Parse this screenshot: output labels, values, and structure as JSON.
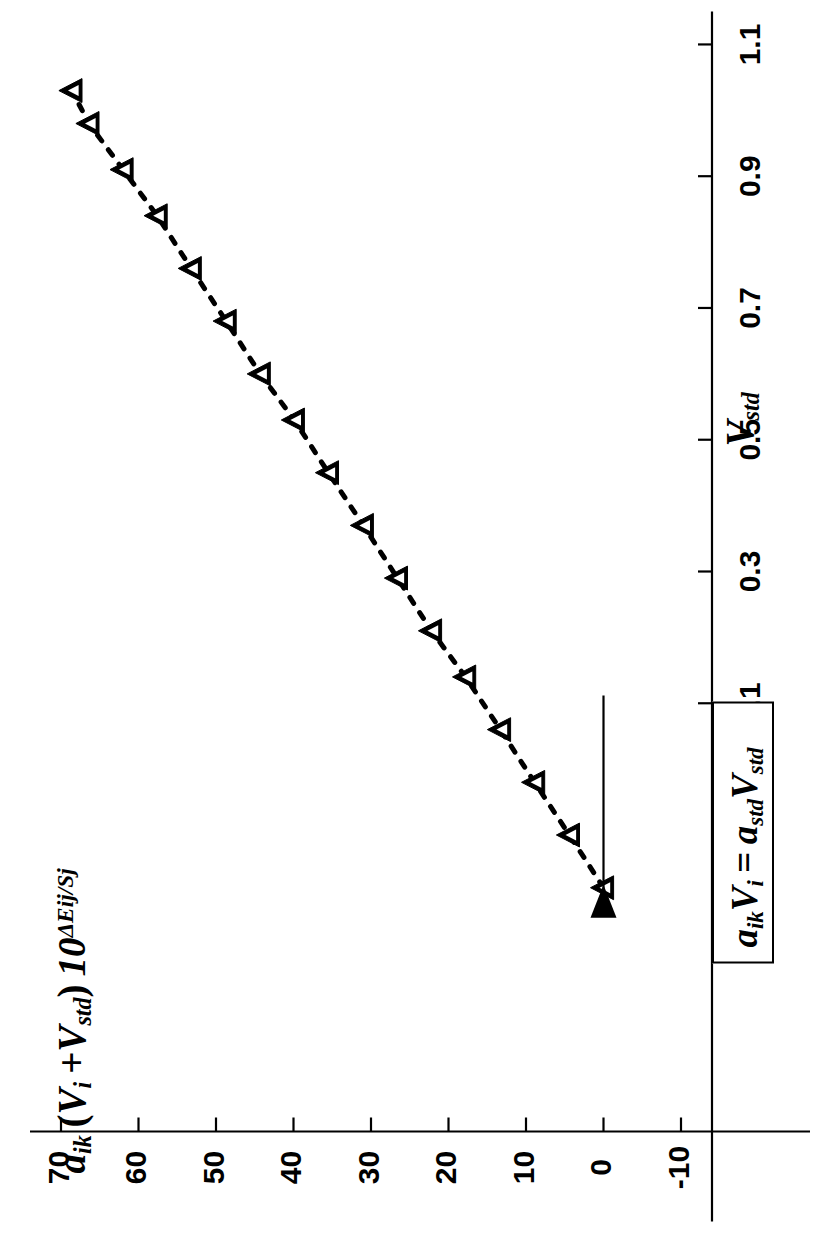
{
  "figure": {
    "type": "scatter-line",
    "background": "#ffffff",
    "ink_color": "#000000",
    "orientation_note": "rotated-90-ccw-on-page"
  },
  "axes": {
    "x": {
      "label_parts": {
        "symbol": "V",
        "subscript": "std"
      },
      "label_text": "V std",
      "ticks": [
        "0.1",
        "0.3",
        "0.5",
        "0.7",
        "0.9",
        "1.1"
      ],
      "tick_values": [
        0.1,
        0.3,
        0.5,
        0.7,
        0.9,
        1.1
      ],
      "min": -0.55,
      "max": 1.15
    },
    "y": {
      "label_parts": {
        "a": "a",
        "a_sub": "ik",
        "open": "(",
        "V1": "V",
        "V1_sub": "i",
        "plus": "+",
        "V2": "V",
        "V2_sub": "std",
        "close": ")",
        "ten": "10",
        "exponent": "ΔEij/Sj"
      },
      "label_text": "a ik(V i +V std) 10 ΔEij/Sj",
      "ticks": [
        "-10",
        "0",
        "10",
        "20",
        "30",
        "40",
        "50",
        "60",
        "70"
      ],
      "tick_values": [
        -10,
        0,
        10,
        20,
        30,
        40,
        50,
        60,
        70
      ],
      "min": -14,
      "max": 74
    }
  },
  "annotation": {
    "box_text": "a ik V i = a std V std",
    "box_parts": {
      "a1": "a",
      "a1_sub": "ik",
      "V1": "V",
      "V1_sub": "i",
      "eq": "=",
      "a2": "a",
      "a2_sub": "std",
      "V2": "V",
      "V2_sub": "std"
    },
    "arrow_target_x": -0.18,
    "arrow_target_y": 0
  },
  "chart_data": {
    "type": "scatter",
    "title": "",
    "xlabel": "V std",
    "ylabel": "a ik(V i +V std) 10 ΔEij/Sj",
    "xlim": [
      -0.55,
      1.15
    ],
    "ylim": [
      -14,
      74
    ],
    "grid": false,
    "legend": null,
    "marker": "open-triangle-up",
    "linestyle": "dotted",
    "xticks": [
      0.1,
      0.3,
      0.5,
      0.7,
      0.9,
      1.1
    ],
    "yticks": [
      -10,
      0,
      10,
      20,
      30,
      40,
      50,
      60,
      70
    ],
    "series": [
      {
        "name": "a_ik(V_i+V_std)10^(dEij/Sj) vs V_std",
        "x": [
          -0.18,
          -0.1,
          -0.02,
          0.06,
          0.14,
          0.21,
          0.29,
          0.37,
          0.45,
          0.53,
          0.6,
          0.68,
          0.76,
          0.84,
          0.91,
          0.98,
          1.03
        ],
        "y": [
          0.0,
          4.4,
          8.9,
          13.3,
          17.8,
          22.2,
          26.6,
          31.0,
          35.5,
          39.9,
          44.3,
          48.7,
          53.2,
          57.6,
          62.0,
          66.4,
          68.6
        ]
      }
    ],
    "annotations": [
      {
        "text": "a ik V i = a std V std",
        "points_to": {
          "x": -0.18,
          "y": 0
        },
        "style": "boxed-with-arrow"
      }
    ]
  },
  "caption": {
    "text": ""
  }
}
